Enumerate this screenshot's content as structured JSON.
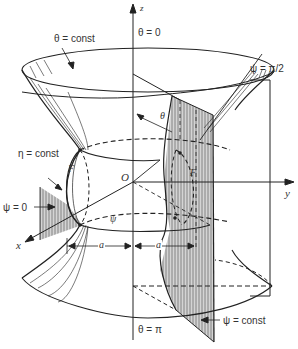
{
  "figure": {
    "type": "3D coordinate surface diagram (oblate spheroidal / toroidal coordinates)",
    "axes": {
      "z": "z",
      "y": "y",
      "x": "x",
      "origin": "O"
    },
    "labels": {
      "theta_const": "θ = const",
      "theta_zero": "θ = 0",
      "theta_pi": "θ = π",
      "psi_half_pi": "ψ = π/2",
      "psi_zero": "ψ = 0",
      "psi_const": "ψ = const",
      "eta_const": "η = const",
      "theta_angle": "θ",
      "psi_angle": "ψ",
      "focus_left": "F",
      "focus_right": "F",
      "dist_a_left": "a",
      "dist_a_right": "a"
    },
    "colors": {
      "line": "#222222",
      "hatch": "#9a9a9a",
      "hatch_bg": "#d8d8d8",
      "background": "#ffffff"
    }
  }
}
